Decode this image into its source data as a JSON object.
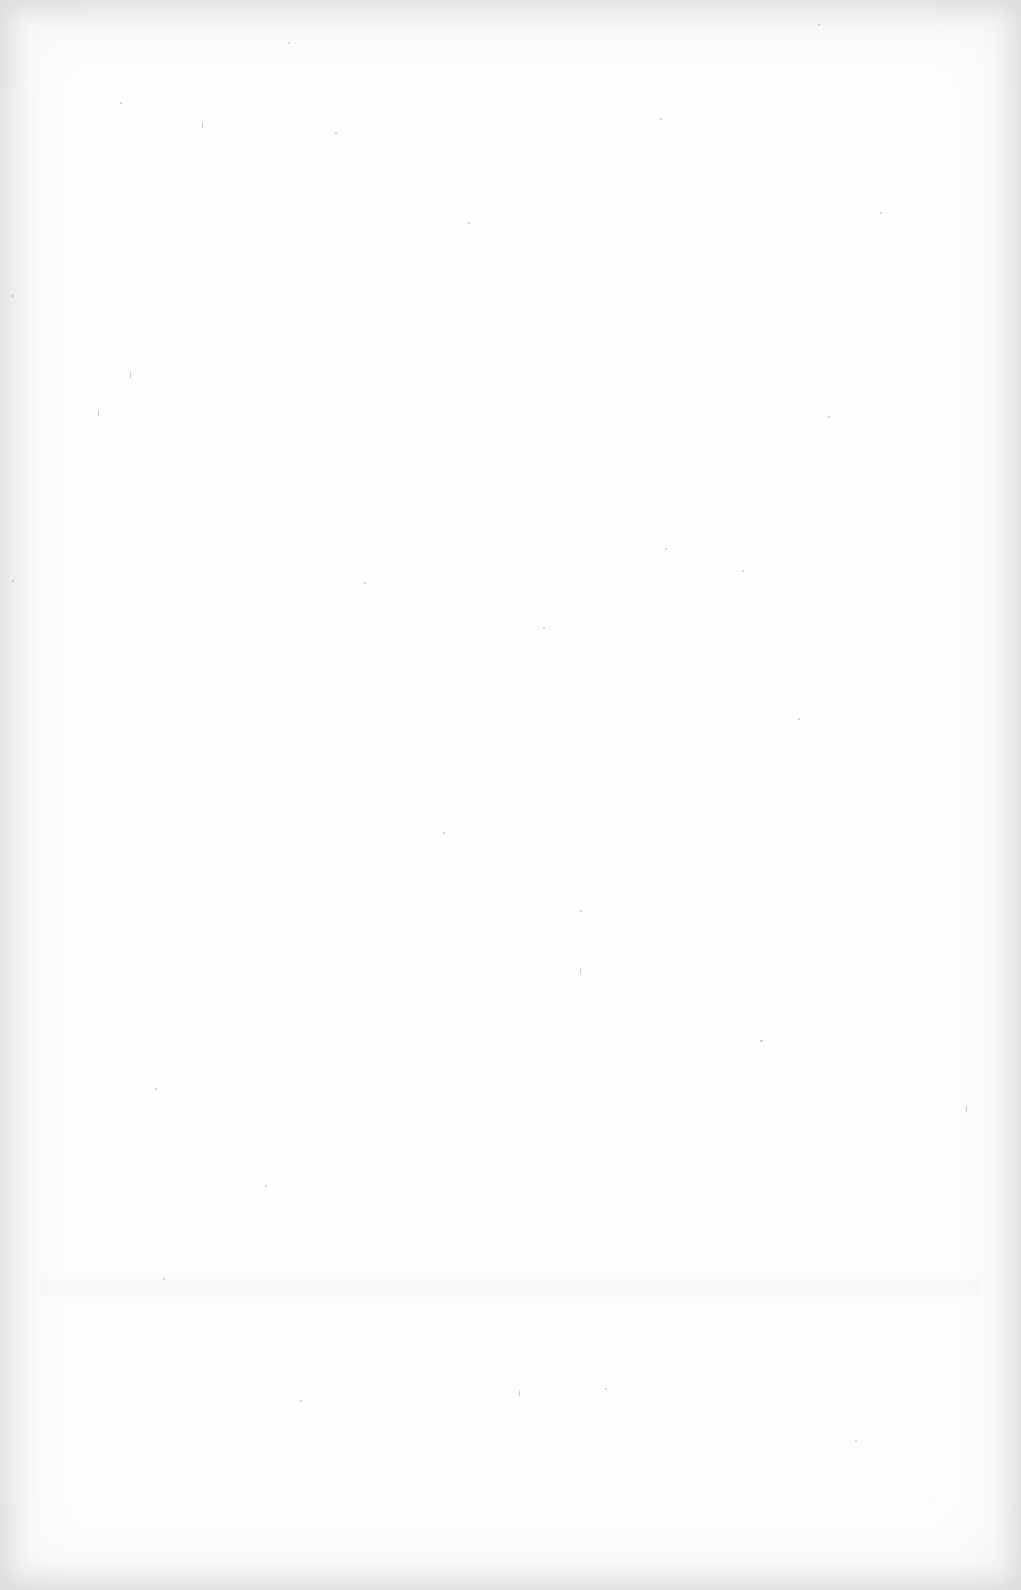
{
  "document": {
    "type": "blank scanned page",
    "text_content": "",
    "background_color": "#fdfdfd",
    "edge_shade_color": "#e0e0e0",
    "speckles": [
      {
        "x": 288,
        "y": 42,
        "w": 2,
        "h": 2
      },
      {
        "x": 202,
        "y": 122,
        "type": "line"
      },
      {
        "x": 120,
        "y": 102,
        "w": 2,
        "h": 2
      },
      {
        "x": 335,
        "y": 132,
        "w": 2,
        "h": 2
      },
      {
        "x": 468,
        "y": 222,
        "w": 2,
        "h": 2
      },
      {
        "x": 130,
        "y": 372,
        "type": "line"
      },
      {
        "x": 98,
        "y": 410,
        "type": "line"
      },
      {
        "x": 660,
        "y": 118,
        "w": 2,
        "h": 2
      },
      {
        "x": 818,
        "y": 24,
        "w": 2,
        "h": 2
      },
      {
        "x": 665,
        "y": 548,
        "w": 2,
        "h": 2
      },
      {
        "x": 828,
        "y": 416,
        "w": 2,
        "h": 2
      },
      {
        "x": 543,
        "y": 627,
        "w": 2,
        "h": 2
      },
      {
        "x": 798,
        "y": 718,
        "w": 2,
        "h": 2
      },
      {
        "x": 443,
        "y": 832,
        "w": 2,
        "h": 2
      },
      {
        "x": 580,
        "y": 910,
        "w": 2,
        "h": 2
      },
      {
        "x": 580,
        "y": 968,
        "type": "line"
      },
      {
        "x": 966,
        "y": 1106,
        "type": "line"
      },
      {
        "x": 760,
        "y": 1040,
        "w": 3,
        "h": 2
      },
      {
        "x": 519,
        "y": 1390,
        "type": "line"
      },
      {
        "x": 605,
        "y": 1388,
        "w": 2,
        "h": 2
      },
      {
        "x": 855,
        "y": 1440,
        "w": 2,
        "h": 2
      },
      {
        "x": 163,
        "y": 1278,
        "w": 2,
        "h": 2
      },
      {
        "x": 155,
        "y": 1088,
        "w": 2,
        "h": 2
      },
      {
        "x": 12,
        "y": 580,
        "w": 2,
        "h": 2
      },
      {
        "x": 12,
        "y": 295,
        "w": 2,
        "h": 2
      },
      {
        "x": 880,
        "y": 212,
        "w": 2,
        "h": 2
      },
      {
        "x": 742,
        "y": 570,
        "w": 2,
        "h": 2
      },
      {
        "x": 364,
        "y": 582,
        "w": 2,
        "h": 2
      },
      {
        "x": 265,
        "y": 1185,
        "w": 2,
        "h": 2
      },
      {
        "x": 300,
        "y": 1400,
        "w": 2,
        "h": 2
      }
    ]
  }
}
